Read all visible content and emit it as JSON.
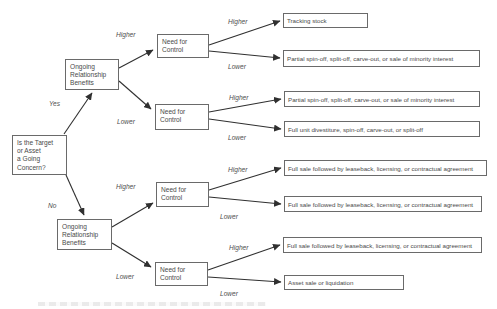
{
  "diagram": {
    "type": "decision-tree",
    "nodes": {
      "question": "Is the Target\nor Asset\na Going\nConcern?",
      "relationship": "Ongoing\nRelationship\nBenefits",
      "control": "Need for\nControl",
      "outcomes": [
        "Tracking stock",
        "Partial spin-off, split-off, carve-out, or sale of minority interest",
        "Partial spin-off, split-off, carve-out, or sale of minority interest",
        "Full unit divestiture, spin-off, carve-out, or split-off",
        "Full sale followed by leaseback, licensing, or contractual agreement",
        "Full sale followed by leaseback, licensing, or contractual agreement",
        "Full sale followed by leaseback, licensing, or contractual agreement",
        "Asset sale or liquidation"
      ]
    },
    "labels": {
      "yes": "Yes",
      "no": "No",
      "higher": "Higher",
      "lower": "Lower"
    },
    "colors": {
      "background": "#ffffff",
      "box_border": "#6a6a6a",
      "text": "#4a4a4a",
      "arrow": "#303030"
    }
  }
}
